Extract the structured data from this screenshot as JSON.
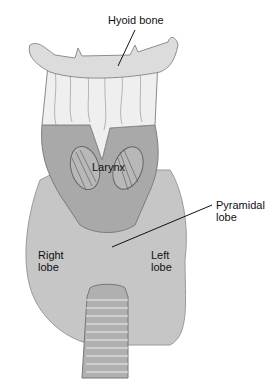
{
  "diagram": {
    "labels": {
      "hyoid_bone": "Hyoid bone",
      "larynx": "Larynx",
      "pyramidal_lobe_line1": "Pyramidal",
      "pyramidal_lobe_line2": "lobe",
      "right_lobe_line1": "Right",
      "right_lobe_line2": "lobe",
      "left_lobe_line1": "Left",
      "left_lobe_line2": "lobe"
    },
    "colors": {
      "hyoid": "#dcdcdc",
      "larynx_upper": "#eeeeee",
      "larynx": "#a8a8a8",
      "thyroid": "#c4c4c4",
      "trachea": "#9e9e9e",
      "outline": "#777777",
      "leader_line": "#111111"
    }
  }
}
